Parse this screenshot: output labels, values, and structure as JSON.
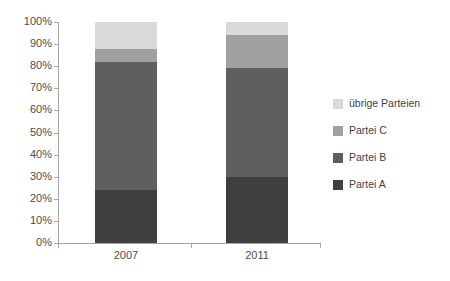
{
  "chart_data": {
    "type": "bar",
    "subtype": "stacked-100-percent",
    "title": "",
    "xlabel": "",
    "ylabel": "",
    "categories": [
      "2007",
      "2011"
    ],
    "ylim": [
      0,
      100
    ],
    "ytick_labels": [
      "0%",
      "10%",
      "20%",
      "30%",
      "40%",
      "50%",
      "60%",
      "70%",
      "80%",
      "90%",
      "100%"
    ],
    "ytick_values": [
      0,
      10,
      20,
      30,
      40,
      50,
      60,
      70,
      80,
      90,
      100
    ],
    "grid": false,
    "legend_position": "right",
    "series": [
      {
        "name": "Partei A",
        "values": [
          24,
          30
        ],
        "color": "#3f3f3f"
      },
      {
        "name": "Partei B",
        "values": [
          58,
          49
        ],
        "color": "#5f5f5f"
      },
      {
        "name": "Partei C",
        "values": [
          6,
          15
        ],
        "color": "#a0a0a0"
      },
      {
        "name": "übrige Parteien",
        "values": [
          12,
          6
        ],
        "color": "#d9d9d9"
      }
    ],
    "stack_tops": {
      "2007": {
        "Partei A": 24,
        "Partei B": 82,
        "Partei C": 88,
        "übrige Parteien": 100
      },
      "2011": {
        "Partei A": 30,
        "Partei B": 79,
        "Partei C": 94,
        "übrige Parteien": 100
      }
    },
    "legend_entries": [
      {
        "label": "übrige Parteien",
        "color": "#d9d9d9"
      },
      {
        "label": "Partei C",
        "color": "#a0a0a0"
      },
      {
        "label": "Partei B",
        "color": "#5f5f5f"
      },
      {
        "label": "Partei A",
        "color": "#3f3f3f"
      }
    ],
    "axis_color": "#a6a6a6",
    "tick_text_color": "#4d4d4d",
    "background": "#ffffff"
  }
}
